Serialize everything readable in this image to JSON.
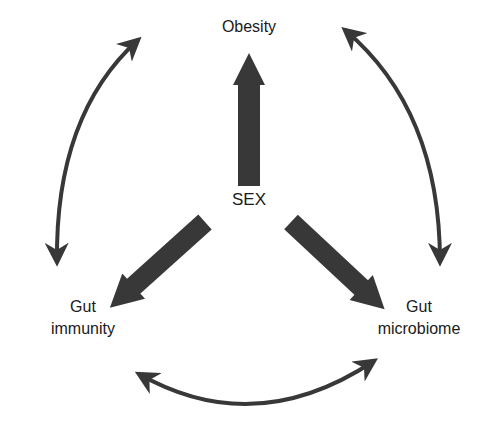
{
  "diagram": {
    "center": {
      "label": "SEX"
    },
    "nodes": [
      {
        "id": "obesity",
        "label": "Obesity"
      },
      {
        "id": "gut-immunity",
        "label_line1": "Gut",
        "label_line2": "immunity"
      },
      {
        "id": "gut-microbiome",
        "label_line1": "Gut",
        "label_line2": "microbiome"
      }
    ],
    "edges": [
      {
        "from": "SEX",
        "to": "Obesity",
        "type": "directed-thick"
      },
      {
        "from": "SEX",
        "to": "Gut immunity",
        "type": "directed-thick"
      },
      {
        "from": "SEX",
        "to": "Gut microbiome",
        "type": "directed-thick"
      },
      {
        "from": "Obesity",
        "to": "Gut immunity",
        "type": "bidirectional-curved"
      },
      {
        "from": "Obesity",
        "to": "Gut microbiome",
        "type": "bidirectional-curved"
      },
      {
        "from": "Gut immunity",
        "to": "Gut microbiome",
        "type": "bidirectional-curved"
      }
    ],
    "colors": {
      "arrow": "#333333",
      "text": "#1a1a1a",
      "background": "#ffffff"
    }
  }
}
